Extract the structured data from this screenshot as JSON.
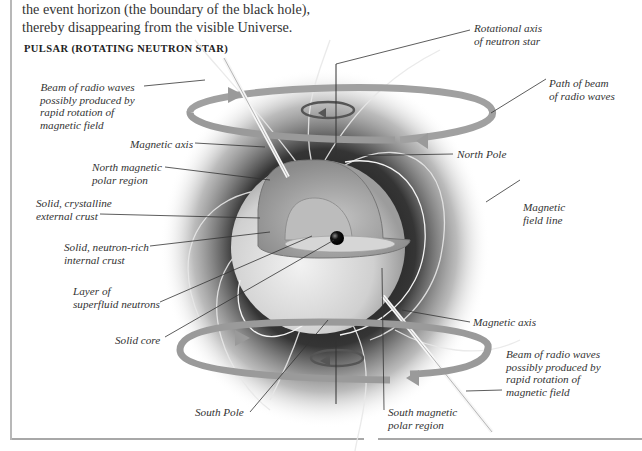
{
  "intro_text": {
    "line1": "the event horizon (the boundary of the black hole),",
    "line2": "thereby disappearing from the visible Universe."
  },
  "section_title": "PULSAR (ROTATING NEUTRON STAR)",
  "labels": {
    "beam_left": [
      "Beam of  radio waves",
      "possibly produced by",
      "rapid rotation of",
      "magnetic field"
    ],
    "magnetic_axis_top": "Magnetic axis",
    "north_magnetic": [
      "North magnetic",
      "polar region"
    ],
    "external_crust": [
      "Solid, crystalline",
      "external crust"
    ],
    "internal_crust": [
      "Solid, neutron-rich",
      "internal crust"
    ],
    "superfluid": [
      "Layer of",
      "superfluid neutrons"
    ],
    "solid_core": "Solid core",
    "south_pole": "South Pole",
    "south_magnetic": [
      "South magnetic",
      "polar region"
    ],
    "rotational_axis": [
      "Rotational axis",
      "of  neutron star"
    ],
    "path_of_beam": [
      "Path of  beam",
      "of  radio waves"
    ],
    "north_pole": "North Pole",
    "field_line": [
      "Magnetic",
      "field line"
    ],
    "magnetic_axis_bottom": "Magnetic axis",
    "beam_right": [
      "Beam of  radio waves",
      "possibly produced by",
      "rapid rotation of",
      "magnetic field"
    ]
  },
  "colors": {
    "ring": "#9a9a9a",
    "glow": "#1a1a1a",
    "star_surface": "#d6d6d6",
    "crust": "#a8a8a8",
    "core": "#111111",
    "leader_line": "#333333",
    "text": "#333333"
  }
}
